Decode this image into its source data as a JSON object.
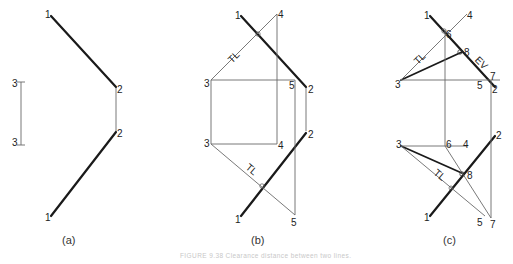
{
  "figure": {
    "caption": "FIGURE 9.38  Clearance distance between two lines.",
    "panels": [
      {
        "id": "a",
        "label": "(a)",
        "points": {
          "top_1": "1",
          "top_2": "2",
          "bottom_2": "2",
          "bottom_1": "1",
          "top_3": "3",
          "bottom_3": "3"
        }
      },
      {
        "id": "b",
        "label": "(b)",
        "points": {
          "top_1": "1",
          "top_4": "4",
          "top_3": "3",
          "top_5": "5",
          "top_2": "2",
          "bottom_2": "2",
          "bottom_3": "3",
          "bottom_4": "4",
          "bottom_1": "1",
          "bottom_5": "5"
        },
        "annotations": {
          "tl_top": "TL",
          "tl_bottom": "TL"
        }
      },
      {
        "id": "c",
        "label": "(c)",
        "points": {
          "top_1": "1",
          "top_4": "4",
          "top_6": "6",
          "top_8": "8",
          "top_3": "3",
          "top_7": "7",
          "top_5": "5",
          "top_2": "2",
          "bottom_3": "3",
          "bottom_6": "6",
          "bottom_4": "4",
          "bottom_2": "2",
          "bottom_8": "8",
          "bottom_1": "1",
          "bottom_5": "5",
          "bottom_7": "7"
        },
        "annotations": {
          "tl_top": "TL",
          "ev": "EV",
          "tl_bottom": "TL"
        }
      }
    ]
  }
}
